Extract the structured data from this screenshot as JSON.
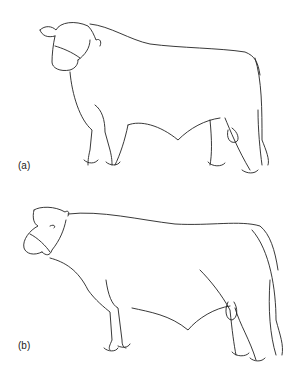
{
  "figures": [
    {
      "id": "a",
      "label": "(a)",
      "subject": "bull-side-view-head-turned"
    },
    {
      "id": "b",
      "label": "(b)",
      "subject": "bull-side-view-profile"
    }
  ],
  "colors": {
    "line": "#222222",
    "background": "#ffffff"
  }
}
